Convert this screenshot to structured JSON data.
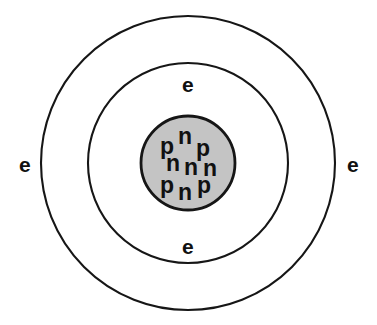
{
  "diagram": {
    "type": "atomic-structure",
    "background_color": "#ffffff",
    "stroke_color": "#161616",
    "nucleus_fill_color": "#c4c4c4",
    "text_color": "#111111"
  },
  "shells": [
    {
      "name": "outer-electron-shell",
      "center_x": 188,
      "center_y": 163,
      "radius": 147,
      "fill": "none",
      "stroke": "#161616"
    },
    {
      "name": "inner-electron-shell",
      "center_x": 188,
      "center_y": 163,
      "radius": 100,
      "fill": "none",
      "stroke": "#161616"
    }
  ],
  "nucleus": {
    "name": "nucleus",
    "center_x": 188,
    "center_y": 163,
    "radius": 47,
    "fill": "#c4c4c4",
    "stroke": "#161616",
    "proton_count": 4,
    "neutron_count": 5,
    "particles": [
      {
        "label": "p",
        "kind": "proton",
        "x": 160,
        "y": 135
      },
      {
        "label": "n",
        "kind": "neutron",
        "x": 178,
        "y": 125
      },
      {
        "label": "p",
        "kind": "proton",
        "x": 196,
        "y": 137
      },
      {
        "label": "n",
        "kind": "neutron",
        "x": 166,
        "y": 152
      },
      {
        "label": "n",
        "kind": "neutron",
        "x": 184,
        "y": 156
      },
      {
        "label": "n",
        "kind": "neutron",
        "x": 203,
        "y": 157
      },
      {
        "label": "p",
        "kind": "proton",
        "x": 160,
        "y": 174
      },
      {
        "label": "n",
        "kind": "neutron",
        "x": 178,
        "y": 181
      },
      {
        "label": "p",
        "kind": "proton",
        "x": 197,
        "y": 174
      }
    ]
  },
  "electrons": [
    {
      "label": "e",
      "position": "left",
      "x": 19,
      "y": 154
    },
    {
      "label": "e",
      "position": "top",
      "x": 182,
      "y": 74
    },
    {
      "label": "e",
      "position": "right",
      "x": 347,
      "y": 154
    },
    {
      "label": "e",
      "position": "bottom",
      "x": 182,
      "y": 236
    }
  ]
}
